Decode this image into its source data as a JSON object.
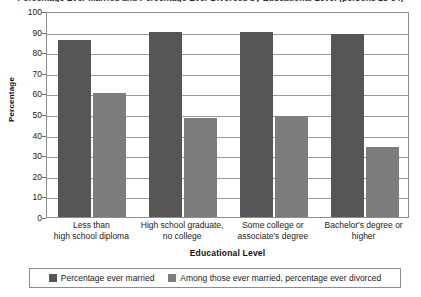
{
  "chart_data": {
    "type": "bar",
    "title": "Percentage Ever Married and Percentage Ever Divorced by Educational Level (persons 25-64)",
    "xlabel": "Educational Level",
    "ylabel": "Percentage",
    "ylim": [
      0,
      100
    ],
    "ytick_step": 10,
    "yticks": [
      0,
      10,
      20,
      30,
      40,
      50,
      60,
      70,
      80,
      90,
      100
    ],
    "grid": true,
    "legend_position": "bottom",
    "categories": [
      "Less than\nhigh school diploma",
      "High school graduate,\nno college",
      "Some college or\nassociate's degree",
      "Bachelor's degree or\nhigher"
    ],
    "category_lines": [
      [
        "Less than",
        "high school diploma"
      ],
      [
        "High school graduate,",
        "no college"
      ],
      [
        "Some college or",
        "associate's degree"
      ],
      [
        "Bachelor's degree or",
        "higher"
      ]
    ],
    "series": [
      {
        "name": "Percentage ever married",
        "color": "#565656",
        "values": [
          86,
          90,
          90,
          89
        ]
      },
      {
        "name": "Among those ever married, percentage ever divorced",
        "color": "#7d7d7d",
        "values": [
          60,
          48,
          49,
          34
        ]
      }
    ]
  },
  "axes": {
    "y_title": "Percentage",
    "x_title": "Educational Level"
  }
}
